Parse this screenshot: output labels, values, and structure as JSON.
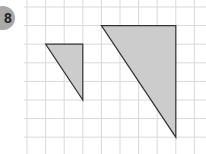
{
  "badge": {
    "label": "8",
    "color": "#a9a9a9"
  },
  "grid": {
    "x0": 27,
    "y0": 7,
    "cell": 18.6,
    "cols": 10,
    "rows": 7,
    "line_color": "#d9d9d9"
  },
  "shapes": [
    {
      "name": "small-triangle",
      "points": [
        [
          1,
          2
        ],
        [
          3,
          2
        ],
        [
          3,
          5
        ]
      ],
      "fill": "#cccccc",
      "stroke": "#333333"
    },
    {
      "name": "large-triangle",
      "points": [
        [
          4,
          1
        ],
        [
          8,
          1
        ],
        [
          8,
          7
        ]
      ],
      "fill": "#cccccc",
      "stroke": "#333333"
    }
  ]
}
